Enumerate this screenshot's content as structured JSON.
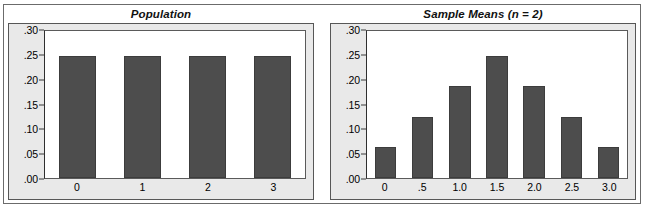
{
  "figure": {
    "panels": [
      {
        "id": "population",
        "title": "Population",
        "y_tick_labels": [
          ".30",
          ".25",
          ".20",
          ".15",
          ".10",
          ".05",
          ".00"
        ]
      },
      {
        "id": "sample-means",
        "title": "Sample Means (n = 2)",
        "y_tick_labels": [
          ".30",
          ".25",
          ".20",
          ".15",
          ".10",
          ".05",
          ".00"
        ]
      }
    ],
    "colors": {
      "bar_fill": "#4d4d4d",
      "bar_border": "#3c3c3c",
      "panel_background": "#e9e9e9",
      "plot_background": "#ffffff",
      "frame_border": "#6b6b6b",
      "axis_line": "#2f2f2f"
    }
  },
  "chart_data": [
    {
      "type": "bar",
      "id": "population",
      "title": "Population",
      "categories": [
        "0",
        "1",
        "2",
        "3"
      ],
      "values": [
        0.25,
        0.25,
        0.25,
        0.25
      ],
      "xlabel": "",
      "ylabel": "",
      "ylim": [
        0.0,
        0.3
      ],
      "yticks": [
        0.0,
        0.05,
        0.1,
        0.15,
        0.2,
        0.25,
        0.3
      ],
      "ytick_labels": [
        ".00",
        ".05",
        ".10",
        ".15",
        ".20",
        ".25",
        ".30"
      ],
      "grid": false,
      "legend": "none"
    },
    {
      "type": "bar",
      "id": "sample-means",
      "title": "Sample Means (n = 2)",
      "categories": [
        "0",
        ".5",
        "1.0",
        "1.5",
        "2.0",
        "2.5",
        "3.0"
      ],
      "values": [
        0.0625,
        0.125,
        0.1875,
        0.25,
        0.1875,
        0.125,
        0.0625
      ],
      "xlabel": "",
      "ylabel": "",
      "ylim": [
        0.0,
        0.3
      ],
      "yticks": [
        0.0,
        0.05,
        0.1,
        0.15,
        0.2,
        0.25,
        0.3
      ],
      "ytick_labels": [
        ".00",
        ".05",
        ".10",
        ".15",
        ".20",
        ".25",
        ".30"
      ],
      "grid": false,
      "legend": "none"
    }
  ]
}
